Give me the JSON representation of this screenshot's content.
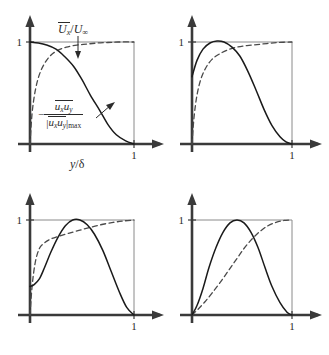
{
  "figure": {
    "panel_count": 4,
    "axis_tick_one": "1",
    "xaxis_label_plain": "y/d",
    "xaxis_label_parts": {
      "numerator": "y",
      "slash": "/",
      "denominator": "δ"
    },
    "mean_velocity_label": {
      "symbol": "U",
      "subscript": "x",
      "divider": "/",
      "denominator_symbol": "U",
      "denominator_subscript": "∞",
      "plain": "Ux/U∞"
    },
    "reynolds_stress_label": {
      "minus": "−",
      "numerator_sym1": "u",
      "numerator_sub1": "x",
      "numerator_sym2": "u",
      "numerator_sub2": "y",
      "denominator_sym1": "u",
      "denominator_sub1": "x",
      "denominator_sym2": "u",
      "denominator_sub2": "y",
      "denominator_suffix": "max",
      "plain": "-(ux uy)/|ux uy|max"
    },
    "colors": {
      "axis": "#3a3a3a",
      "frame": "#8a8a8a",
      "curve_solid": "#1a1a1a",
      "curve_dashed": "#4a4a4a",
      "text": "#2b2b2b",
      "background": "#ffffff"
    }
  },
  "chart_data": {
    "type": "line",
    "title": "",
    "xlabel": "y/δ",
    "ylabel": "",
    "xlim": [
      0,
      1.12
    ],
    "ylim": [
      0,
      1.18
    ],
    "xticks": [
      1
    ],
    "xticklabels": [
      "1"
    ],
    "yticks": [
      1
    ],
    "yticklabels": [
      "1"
    ],
    "grid": false,
    "legend": "annotations",
    "panels": [
      {
        "id": "panel-1",
        "position": "top-left",
        "annotations": [
          "Ux/U∞",
          "-(ux uy)/|ux uy|max"
        ],
        "series": [
          {
            "name": "mean velocity",
            "style": "dashed",
            "x": [
              0.0,
              0.02,
              0.05,
              0.09,
              0.14,
              0.2,
              0.27,
              0.35,
              0.45,
              0.55,
              0.65,
              0.75,
              0.85,
              1.0
            ],
            "values": [
              0.0,
              0.3,
              0.52,
              0.68,
              0.79,
              0.87,
              0.92,
              0.95,
              0.97,
              0.98,
              0.99,
              0.995,
              1.0,
              1.0
            ]
          },
          {
            "name": "Reynolds shear stress",
            "style": "solid",
            "x": [
              0.0,
              0.08,
              0.16,
              0.25,
              0.33,
              0.42,
              0.5,
              0.58,
              0.67,
              0.75,
              0.83,
              0.92,
              1.0
            ],
            "values": [
              1.0,
              0.99,
              0.97,
              0.93,
              0.86,
              0.76,
              0.63,
              0.48,
              0.33,
              0.19,
              0.09,
              0.03,
              0.0
            ]
          }
        ]
      },
      {
        "id": "panel-2",
        "position": "top-right",
        "annotations": [],
        "series": [
          {
            "name": "mean velocity",
            "style": "dashed",
            "x": [
              0.0,
              0.02,
              0.05,
              0.09,
              0.14,
              0.2,
              0.27,
              0.35,
              0.45,
              0.55,
              0.65,
              0.75,
              0.85,
              1.0
            ],
            "values": [
              0.0,
              0.26,
              0.48,
              0.64,
              0.75,
              0.83,
              0.88,
              0.92,
              0.95,
              0.965,
              0.975,
              0.985,
              0.995,
              1.0
            ]
          },
          {
            "name": "Reynolds shear stress",
            "style": "solid",
            "x": [
              0.0,
              0.05,
              0.11,
              0.18,
              0.25,
              0.32,
              0.4,
              0.48,
              0.56,
              0.64,
              0.72,
              0.8,
              0.88,
              0.94,
              1.0
            ],
            "values": [
              0.66,
              0.82,
              0.93,
              0.99,
              1.01,
              1.0,
              0.95,
              0.86,
              0.71,
              0.53,
              0.34,
              0.18,
              0.07,
              0.02,
              0.0
            ]
          }
        ]
      },
      {
        "id": "panel-3",
        "position": "bottom-left",
        "annotations": [],
        "series": [
          {
            "name": "mean velocity",
            "style": "dashed",
            "x": [
              0.0,
              0.02,
              0.05,
              0.09,
              0.14,
              0.2,
              0.28,
              0.37,
              0.47,
              0.57,
              0.68,
              0.8,
              0.9,
              1.0
            ],
            "values": [
              0.0,
              0.3,
              0.55,
              0.7,
              0.76,
              0.8,
              0.83,
              0.86,
              0.89,
              0.92,
              0.95,
              0.975,
              0.99,
              1.0
            ]
          },
          {
            "name": "Reynolds shear stress",
            "style": "solid",
            "x": [
              0.0,
              0.04,
              0.09,
              0.14,
              0.2,
              0.27,
              0.34,
              0.41,
              0.48,
              0.55,
              0.62,
              0.7,
              0.78,
              0.86,
              0.93,
              1.0
            ],
            "values": [
              0.3,
              0.32,
              0.38,
              0.5,
              0.66,
              0.82,
              0.94,
              1.0,
              1.0,
              0.95,
              0.85,
              0.68,
              0.46,
              0.24,
              0.08,
              0.0
            ]
          }
        ]
      },
      {
        "id": "panel-4",
        "position": "bottom-right",
        "annotations": [],
        "series": [
          {
            "name": "mean velocity",
            "style": "dashed",
            "x": [
              0.0,
              0.06,
              0.13,
              0.2,
              0.28,
              0.36,
              0.44,
              0.52,
              0.6,
              0.68,
              0.76,
              0.84,
              0.92,
              1.0
            ],
            "values": [
              0.0,
              0.06,
              0.14,
              0.23,
              0.34,
              0.46,
              0.58,
              0.7,
              0.8,
              0.88,
              0.94,
              0.975,
              0.995,
              1.0
            ]
          },
          {
            "name": "Reynolds shear stress",
            "style": "solid",
            "x": [
              0.0,
              0.05,
              0.11,
              0.17,
              0.24,
              0.31,
              0.38,
              0.45,
              0.52,
              0.59,
              0.66,
              0.73,
              0.8,
              0.88,
              0.95,
              1.0
            ],
            "values": [
              0.0,
              0.1,
              0.28,
              0.5,
              0.71,
              0.87,
              0.97,
              1.0,
              0.97,
              0.87,
              0.71,
              0.5,
              0.3,
              0.13,
              0.03,
              0.0
            ]
          }
        ]
      }
    ]
  }
}
